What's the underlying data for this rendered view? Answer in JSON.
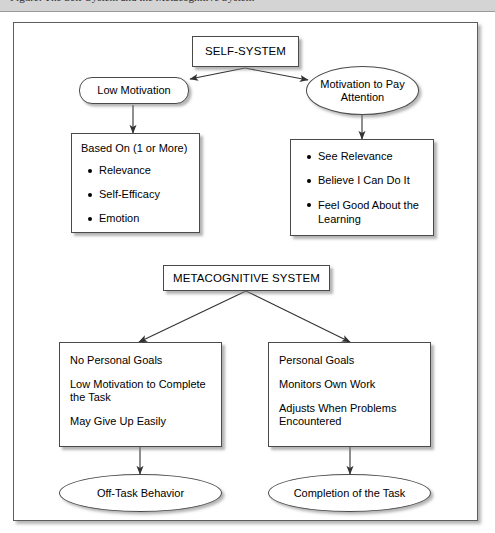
{
  "header": {
    "caption": "Figure: The Self-System and the Metacognitive System"
  },
  "diagram": {
    "nodes": {
      "self_system": {
        "label": "SELF-SYSTEM",
        "shape": "rect"
      },
      "low_motivation": {
        "label": "Low Motivation",
        "shape": "rounded"
      },
      "motivation_to_pay_attention": {
        "label": "Motivation to Pay Attention",
        "line1": "Motivation to Pay",
        "line2": "Attention",
        "shape": "ellipse"
      },
      "based_on_box": {
        "heading": "Based On (1 or More)",
        "shape": "listbox",
        "bullets": [
          "Relevance",
          "Self-Efficacy",
          "Emotion"
        ]
      },
      "positive_box": {
        "shape": "listbox",
        "bullets": [
          "See Relevance",
          "Believe I Can Do It",
          "Feel Good About the Learning"
        ]
      },
      "metacognitive_system": {
        "label": "METACOGNITIVE SYSTEM",
        "shape": "rect"
      },
      "negative_outcomes_box": {
        "shape": "listbox",
        "lines": [
          "No Personal Goals",
          "Low Motivation to Complete the Task",
          "May Give Up Easily"
        ]
      },
      "positive_outcomes_box": {
        "shape": "listbox",
        "lines": [
          "Personal Goals",
          "Monitors Own Work",
          "Adjusts When Problems Encountered"
        ]
      },
      "off_task_behavior": {
        "label": "Off-Task Behavior",
        "shape": "ellipse"
      },
      "completion_of_task": {
        "label": "Completion of the Task",
        "shape": "ellipse"
      }
    },
    "edges": [
      {
        "from": "self_system",
        "to": "low_motivation",
        "style": "arrow"
      },
      {
        "from": "self_system",
        "to": "motivation_to_pay_attention",
        "style": "arrow"
      },
      {
        "from": "low_motivation",
        "to": "based_on_box",
        "style": "arrow"
      },
      {
        "from": "motivation_to_pay_attention",
        "to": "positive_box",
        "style": "arrow"
      },
      {
        "from": "metacognitive_system",
        "to": "negative_outcomes_box",
        "style": "arrow"
      },
      {
        "from": "metacognitive_system",
        "to": "positive_outcomes_box",
        "style": "arrow"
      },
      {
        "from": "negative_outcomes_box",
        "to": "off_task_behavior",
        "style": "arrow"
      },
      {
        "from": "positive_outcomes_box",
        "to": "completion_of_task",
        "style": "arrow"
      }
    ],
    "colors": {
      "stroke": "#4a4a4a",
      "frame": "#5d5d5d",
      "background": "#ffffff",
      "text": "#000000",
      "header_band": "#d4d4d4"
    }
  }
}
